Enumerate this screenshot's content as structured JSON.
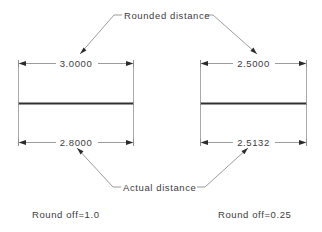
{
  "drawing": {
    "title_note_top": "Rounded distance",
    "title_note_bottom": "Actual distance",
    "left_block": {
      "rounded_value": "3.0000",
      "actual_value": "2.8000",
      "caption": "Round off=1.0"
    },
    "right_block": {
      "rounded_value": "2.5000",
      "actual_value": "2.5132",
      "caption": "Round off=0.25"
    },
    "colors": {
      "background": "#ffffff",
      "thin_line": "#8a8a8a",
      "extension_line": "#9a9a9a",
      "thick_bar": "#303030",
      "arrow_fill": "#2b2b2b",
      "text": "#3c3c3c"
    }
  }
}
